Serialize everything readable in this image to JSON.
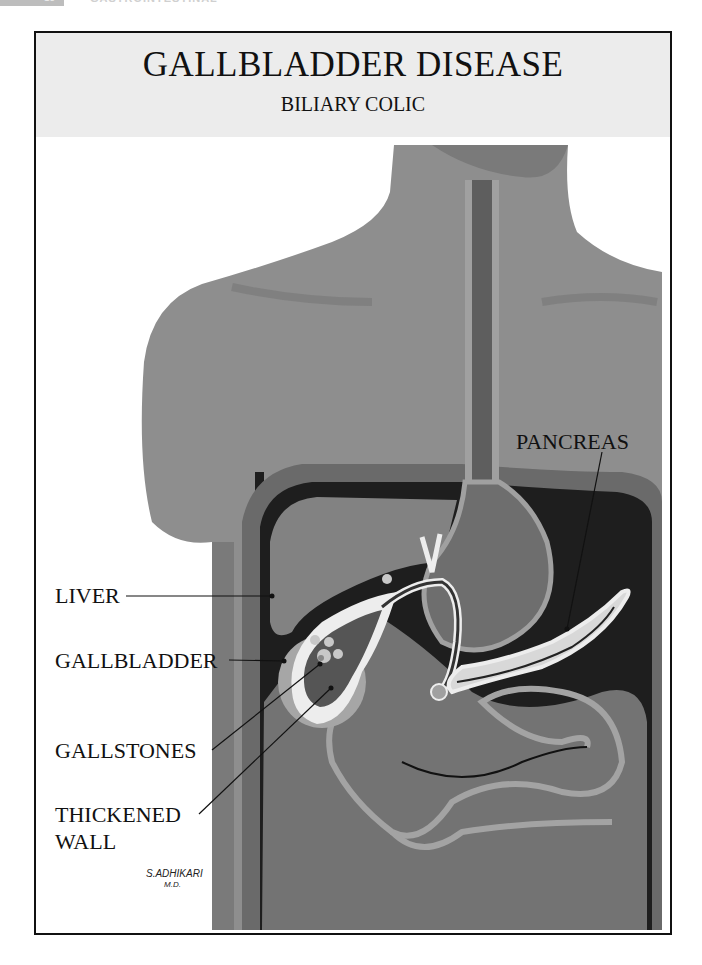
{
  "page_header": {
    "page_number": "18",
    "chapter": "GASTROINTESTINAL"
  },
  "figure": {
    "title": "GALLBLADDER DISEASE",
    "subtitle": "BILIARY COLIC",
    "labels": {
      "liver": "LIVER",
      "gallbladder": "GALLBLADDER",
      "gallstones": "GALLSTONES",
      "thickened_wall_1": "THICKENED",
      "thickened_wall_2": "WALL",
      "pancreas": "PANCREAS"
    },
    "signature": {
      "name": "S.ADHIKARI",
      "credential": "M.D."
    }
  },
  "colors": {
    "frame": "#111111",
    "title_band": "#ececec",
    "skin": "#8c8c8c",
    "dark": "#1e1e1e"
  }
}
